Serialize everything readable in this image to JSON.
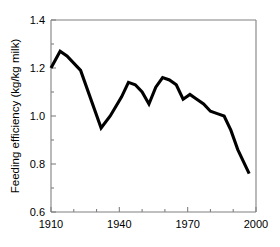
{
  "chart_data": {
    "type": "line",
    "title": "",
    "subtitle": "",
    "xlabel": "",
    "ylabel": "Feeding efficiency (kg/kg milk)",
    "xlim": [
      1910,
      2000
    ],
    "ylim": [
      0.6,
      1.4
    ],
    "grid": false,
    "legend": null,
    "legend_position": "none",
    "x_ticks": [
      1910,
      1940,
      1970,
      2000
    ],
    "x_tick_labels": [
      "1910",
      "1940",
      "1970",
      "2000"
    ],
    "x_minor_ticks": [
      1920,
      1930,
      1950,
      1960,
      1980,
      1990
    ],
    "y_ticks": [
      0.6,
      0.8,
      1.0,
      1.2,
      1.4
    ],
    "y_tick_labels": [
      "0.6",
      "0.8",
      "1.0",
      "1.2",
      "1.4"
    ],
    "y_minor_ticks": [
      0.7,
      0.9,
      1.1,
      1.3
    ],
    "series": [
      {
        "name": "Feeding efficiency",
        "color": "#000000",
        "x": [
          1910,
          1914,
          1917,
          1923,
          1932,
          1936,
          1941,
          1944,
          1947,
          1950,
          1953,
          1956,
          1959,
          1962,
          1965,
          1968,
          1971,
          1974,
          1977,
          1980,
          1983,
          1986,
          1989,
          1992,
          1997
        ],
        "values": [
          1.2,
          1.27,
          1.25,
          1.19,
          0.95,
          1.0,
          1.08,
          1.14,
          1.13,
          1.1,
          1.05,
          1.12,
          1.16,
          1.15,
          1.13,
          1.07,
          1.09,
          1.07,
          1.05,
          1.02,
          1.01,
          1.0,
          0.94,
          0.86,
          0.76
        ]
      }
    ]
  },
  "axes": {
    "y_axis_title": "Feeding efficiency (kg/kg milk)"
  },
  "caption": {
    "ghost_text": ""
  }
}
